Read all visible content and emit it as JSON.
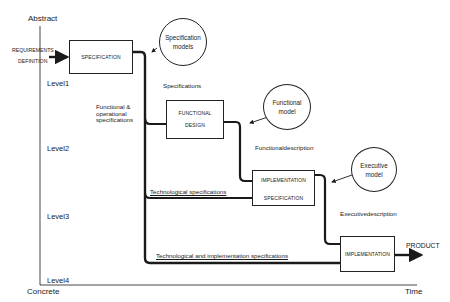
{
  "axes": {
    "y_top": "Abstract",
    "y_bottom": "Concrete",
    "x_right": "Time"
  },
  "levels": [
    "Level1",
    "Level2",
    "Level3",
    "Level4"
  ],
  "input": {
    "line1": "REQUIREMENTS",
    "line2": "DEFINITION"
  },
  "boxes": {
    "specification": "SPECIFICATION",
    "functional_design_1": "FUNCTIONAL",
    "functional_design_2": "DESIGN",
    "implementation_spec_1": "IMPLEMENTATION",
    "implementation_spec_2": "SPECIFICATION",
    "implementation": "IMPLEMENTATION"
  },
  "models": {
    "specification_1": "Specification",
    "specification_2": "models",
    "functional_1": "Functional",
    "functional_2": "model",
    "executive_1": "Executive",
    "executive_2": "model"
  },
  "flow_labels": {
    "specifications": "Specifications",
    "functional_operational_1": "Functional &",
    "functional_operational_2": "operational",
    "functional_operational_3": "specifications",
    "functional_description": "Functionaldescription",
    "technological_specifications": "Technological specifications",
    "executive_description": "Executivedescription",
    "tech_impl_specifications": "Technological and implementation specifications",
    "product": "PRODUCT"
  },
  "colors": {
    "line": "#1a1a1a",
    "background": "#ffffff"
  }
}
